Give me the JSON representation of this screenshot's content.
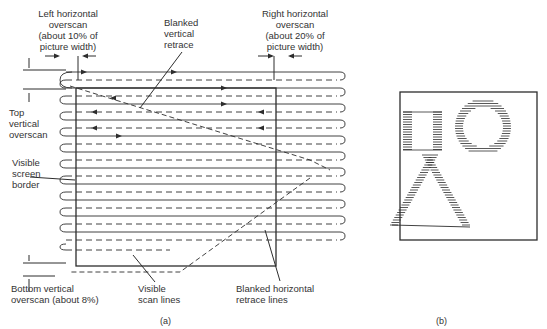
{
  "figure_a": {
    "caption": "(a)",
    "labels": {
      "left_overscan": [
        "Left horizontal",
        "overscan",
        "(about 10% of",
        "picture width)"
      ],
      "blanked_vertical": [
        "Blanked",
        "vertical",
        "retrace"
      ],
      "right_overscan": [
        "Right horizontal",
        "overscan",
        "(about 20% of",
        "picture width)"
      ],
      "top_vertical": [
        "Top",
        "vertical",
        "overscan"
      ],
      "visible_border": [
        "Visible",
        "screen",
        "border"
      ],
      "bottom_vertical": [
        "Bottom vertical",
        "overscan (about 8%)"
      ],
      "visible_scan": [
        "Visible",
        "scan lines"
      ],
      "blanked_horizontal": [
        "Blanked horizontal",
        "retrace lines"
      ]
    },
    "scan_line_count": 11
  },
  "figure_b": {
    "caption": "(b)",
    "shapes": [
      "rectangle",
      "circle",
      "triangle"
    ]
  }
}
